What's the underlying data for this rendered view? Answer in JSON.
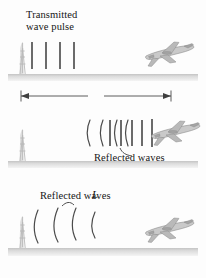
{
  "figure": {
    "kind": "radar-ranging-diagram",
    "panel_count": 3,
    "background_color": "#fdfdfd",
    "ink_color": "#3a3a3a",
    "ground_color": "#d8d8d8"
  },
  "panels": [
    {
      "id": "panel-transmit",
      "label": "Transmitted\nwave pulse",
      "label_line1": "Transmitted",
      "label_line2": "wave pulse",
      "pulse_bar_count": 4,
      "plane_present": true,
      "plane_position": "right",
      "tower_present": true
    },
    {
      "id": "panel-dimension",
      "dimension_label": "L",
      "dimension_has_arrows": "both",
      "label": "Reflected waves",
      "reflected_bar_count": 5,
      "reflected_arc_count": 3,
      "plane_present": true,
      "plane_position": "right",
      "tower_present": true
    },
    {
      "id": "panel-return",
      "label": "Reflected waves",
      "arc_count": 4,
      "plane_present": true,
      "plane_position": "right",
      "tower_present": true
    }
  ],
  "icons": {
    "airplane": "airplane-icon",
    "radar_tower": "radar-tower-icon",
    "arrow_left": "arrow-left-icon",
    "arrow_right": "arrow-right-icon"
  }
}
